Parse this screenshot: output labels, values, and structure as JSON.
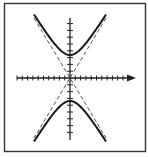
{
  "figure": {
    "type": "hyperbola-diagram",
    "colors": {
      "background": "#ffffff",
      "frame": "#333333",
      "axis": "#222222",
      "curve": "#1a1a1a",
      "asymptote": "#555555"
    },
    "frame": {
      "x": 4.5,
      "y": 3.5,
      "width": 141,
      "height": 148
    },
    "origin": {
      "x": 70,
      "y": 78
    },
    "x_axis": {
      "x_start": 17,
      "x_end": 136,
      "arrow": true,
      "tick_spacing": 5.3,
      "ticks_left": 10,
      "ticks_right": 11
    },
    "y_axis": {
      "y_start": 18,
      "y_end": 140,
      "arrow": false,
      "tick_spacing": 6.8,
      "ticks_up": 8,
      "ticks_down": 8
    },
    "hyperbola": {
      "orientation": "vertical",
      "a_px": 23,
      "b_px": 14,
      "branches": [
        "upper",
        "lower"
      ]
    },
    "asymptotes": {
      "style": "dashed",
      "slope": 1.66,
      "lines": [
        {
          "x1": 34,
          "y1": 18,
          "x2": 106,
          "y2": 138
        },
        {
          "x1": 106,
          "y1": 18,
          "x2": 34,
          "y2": 138
        }
      ]
    }
  }
}
